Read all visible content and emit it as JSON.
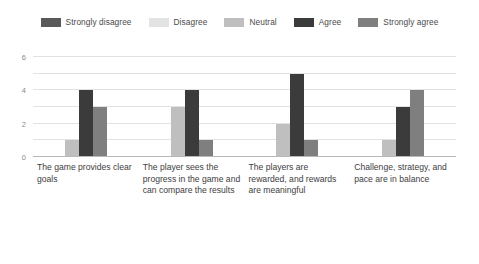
{
  "chart_data": {
    "type": "bar",
    "title": "",
    "subtitle": "",
    "xlabel": "",
    "ylabel": "",
    "ylim": [
      0,
      6
    ],
    "yticks": [
      0,
      2,
      4,
      6
    ],
    "ytick_labels": [
      "0",
      "2",
      "4",
      "6"
    ],
    "gridlines": [
      0,
      1,
      2,
      3,
      4,
      5,
      6
    ],
    "grid": true,
    "legend_position": "top",
    "orientation": "vertical",
    "grouped": true,
    "categories": [
      "The game provides clear goals",
      "The player sees the progress in the game and can compare the results",
      "The players are rewarded, and rewards are meaningful",
      "Challenge, strategy, and pace are in balance"
    ],
    "series": [
      {
        "name": "Strongly disagree",
        "color": "#595959",
        "values": [
          0,
          0,
          0,
          0
        ]
      },
      {
        "name": "Disagree",
        "color": "#e3e3e3",
        "values": [
          0,
          0,
          0,
          0
        ]
      },
      {
        "name": "Neutral",
        "color": "#bfbfbf",
        "values": [
          1,
          3,
          2,
          1
        ]
      },
      {
        "name": "Agree",
        "color": "#3b3b3b",
        "values": [
          4,
          4,
          5,
          3
        ]
      },
      {
        "name": "Strongly agree",
        "color": "#7f7f7f",
        "values": [
          3,
          1,
          1,
          4
        ]
      }
    ]
  },
  "colors": {
    "background": "#ffffff",
    "gridline": "#e2e2e2",
    "axis": "#b8b8b8",
    "tick_text": "#8a8a8a",
    "label_text": "#3d3d3d",
    "legend_text": "#4a4a4a"
  }
}
